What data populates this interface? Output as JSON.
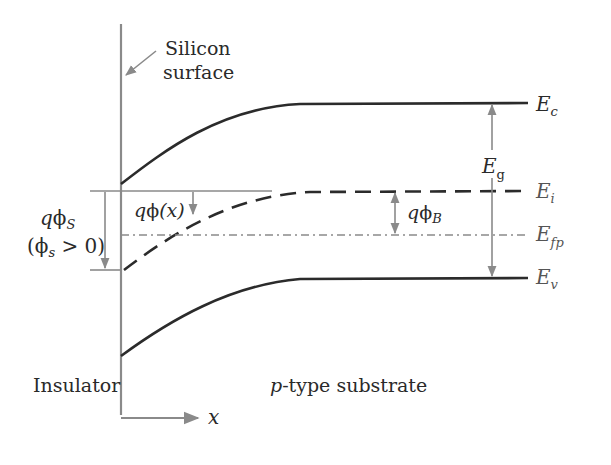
{
  "diagram": {
    "labels": {
      "silicon_surface_line1": "Silicon",
      "silicon_surface_line2": "surface",
      "insulator": "Insulator",
      "substrate_prefix": "p",
      "substrate_suffix": "-type substrate",
      "x_axis": "x",
      "ec": {
        "main": "E",
        "sub": "c"
      },
      "ei": {
        "main": "E",
        "sub": "i"
      },
      "efp": {
        "main": "E",
        "sub": "fp"
      },
      "ev": {
        "main": "E",
        "sub": "v"
      },
      "eg": {
        "main": "E",
        "sub": "g"
      },
      "q_phi_s": {
        "q": "q",
        "phi": "ϕ",
        "sub": "S"
      },
      "phi_s_condition": {
        "open": "(",
        "phi": "ϕ",
        "sub": "s",
        "rest": " > 0)"
      },
      "q_phi_x": {
        "q": "q",
        "phi": "ϕ",
        "arg": "(x)"
      },
      "q_phi_b": {
        "q": "q",
        "phi": "ϕ",
        "sub": "B"
      }
    },
    "levels": [
      {
        "name": "Conduction band edge",
        "symbol": "Ec",
        "style": "solid",
        "surface_y": 184,
        "bulk_y": 103
      },
      {
        "name": "Intrinsic level",
        "symbol": "Ei",
        "style": "dashed",
        "surface_y": 270,
        "bulk_y": 191
      },
      {
        "name": "Fermi level (p-type)",
        "symbol": "Efp",
        "style": "dash-dot",
        "surface_y": 235,
        "bulk_y": 235
      },
      {
        "name": "Valence band edge",
        "symbol": "Ev",
        "style": "solid",
        "surface_y": 356,
        "bulk_y": 278
      }
    ],
    "colors": {
      "band_lines": "#2b2b2b",
      "annotation_gray": "#8a8a8a",
      "text": "#2a2a2a"
    }
  }
}
